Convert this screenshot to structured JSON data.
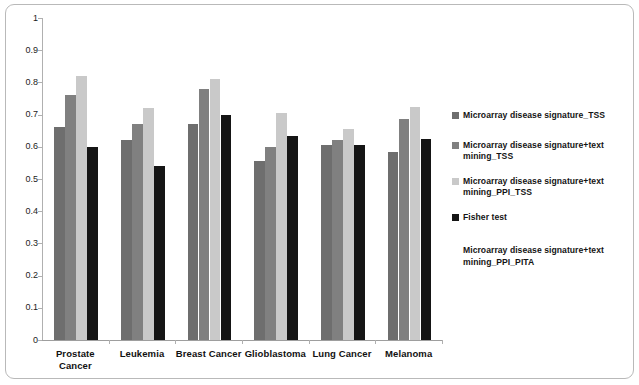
{
  "chart_data": {
    "type": "bar",
    "title": "",
    "subtitle": "",
    "xlabel": "",
    "ylabel": "",
    "ylim": [
      0,
      1
    ],
    "yticks": [
      "0",
      "0.1",
      "0.2",
      "0.3",
      "0.4",
      "0.5",
      "0.6",
      "0.7",
      "0.8",
      "0.9",
      "1"
    ],
    "grid": false,
    "legend_position": "right",
    "categories": [
      "Prostate Cancer",
      "Leukemia",
      "Breast Cancer",
      "Glioblastoma",
      "Lung Cancer",
      "Melanoma"
    ],
    "category_lines": [
      [
        "Prostate",
        "Cancer"
      ],
      [
        "Leukemia"
      ],
      [
        "Breast Cancer"
      ],
      [
        "Glioblastoma"
      ],
      [
        "Lung Cancer"
      ],
      [
        "Melanoma"
      ]
    ],
    "series": [
      {
        "name": "Microarray disease signature_TSS",
        "color": "#6e6e6e",
        "values": [
          0.66,
          0.62,
          0.67,
          0.555,
          0.605,
          0.585
        ]
      },
      {
        "name": "Microarray disease signature+text mining_TSS",
        "color": "#808080",
        "values": [
          0.76,
          0.67,
          0.78,
          0.6,
          0.62,
          0.685
        ]
      },
      {
        "name": "Microarray disease signature+text mining_PPI_TSS",
        "color": "#c9c9c9",
        "values": [
          0.82,
          0.72,
          0.81,
          0.705,
          0.655,
          0.725
        ]
      },
      {
        "name": "Fisher test",
        "color": "#151515",
        "values": [
          0.6,
          0.54,
          0.7,
          0.635,
          0.605,
          0.625
        ]
      }
    ]
  },
  "legend": {
    "entries": [
      {
        "label": "Microarray disease signature_TSS",
        "color": "#6e6e6e",
        "has_swatch": true
      },
      {
        "label": "Microarray disease signature+text mining_TSS",
        "color": "#808080",
        "has_swatch": true
      },
      {
        "label": "Microarray disease signature+text mining_PPI_TSS",
        "color": "#c9c9c9",
        "has_swatch": true
      },
      {
        "label": "Fisher test",
        "color": "#151515",
        "has_swatch": true
      },
      {
        "label": "Microarray disease signature+text mining_PPI_PITA",
        "color": "#ffffff",
        "has_swatch": false
      }
    ]
  },
  "colors": {
    "background": "#ffffff",
    "frame_border": "#b9b9b9",
    "axis": "#b0b0b0",
    "text": "#111111"
  }
}
